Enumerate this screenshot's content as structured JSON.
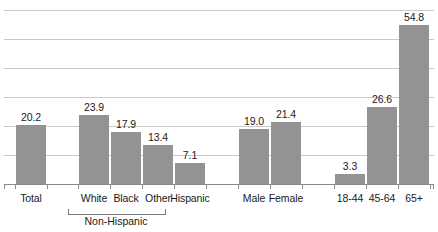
{
  "chart_data": {
    "type": "bar",
    "title": "",
    "subtitle": "",
    "xlabel": "",
    "ylabel": "",
    "ylim": [
      0,
      60
    ],
    "grid": true,
    "gridline_values": [
      60,
      50,
      40,
      30,
      20,
      10
    ],
    "legend": "none",
    "bar_color": "#939393",
    "gridline_color": "#c9c9c9",
    "axis_color": "#8a8a8a",
    "categories": [
      "Total",
      "White",
      "Black",
      "Other",
      "Hispanic",
      "Male",
      "Female",
      "18-44",
      "45-64",
      "65+"
    ],
    "values": [
      20.2,
      23.9,
      17.9,
      13.4,
      7.1,
      19.0,
      21.4,
      3.3,
      26.6,
      54.8
    ],
    "value_labels": [
      "20.2",
      "23.9",
      "17.9",
      "13.4",
      "7.1",
      "19.0",
      "21.4",
      "3.3",
      "26.6",
      "54.8"
    ],
    "bars": [
      {
        "label": "Total",
        "value": 20.2,
        "value_label": "20.2",
        "x": 16,
        "width": 30
      },
      {
        "label": "White",
        "value": 23.9,
        "value_label": "23.9",
        "x": 79,
        "width": 30
      },
      {
        "label": "Black",
        "value": 17.9,
        "value_label": "17.9",
        "x": 111,
        "width": 30
      },
      {
        "label": "Other",
        "value": 13.4,
        "value_label": "13.4",
        "x": 143,
        "width": 30
      },
      {
        "label": "Hispanic",
        "value": 7.1,
        "value_label": "7.1",
        "x": 175,
        "width": 30
      },
      {
        "label": "Male",
        "value": 19.0,
        "value_label": "19.0",
        "x": 239,
        "width": 30
      },
      {
        "label": "Female",
        "value": 21.4,
        "value_label": "21.4",
        "x": 271,
        "width": 30
      },
      {
        "label": "18-44",
        "value": 3.3,
        "value_label": "3.3",
        "x": 335,
        "width": 30
      },
      {
        "label": "45-64",
        "value": 26.6,
        "value_label": "26.6",
        "x": 367,
        "width": 30
      },
      {
        "label": "65+",
        "value": 54.8,
        "value_label": "54.8",
        "x": 399,
        "width": 30
      }
    ],
    "group_bracket": {
      "label": "Non-Hispanic",
      "covers": [
        "White",
        "Black",
        "Other"
      ]
    }
  }
}
